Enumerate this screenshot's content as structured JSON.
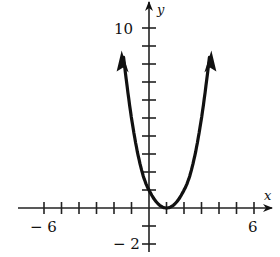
{
  "chart_data": {
    "type": "line",
    "title": "",
    "function": "y = (x - 1)^2",
    "xlabel": "x",
    "ylabel": "y",
    "xlim": [
      -6,
      6
    ],
    "ylim": [
      -2,
      10
    ],
    "x_tick_step": 1,
    "y_tick_step": 1,
    "x_tick_labels": [
      "-6",
      "6"
    ],
    "y_tick_labels": [
      "10",
      "-2"
    ],
    "vertex": [
      1,
      0
    ],
    "y_intercept": [
      0,
      1
    ],
    "series": [
      {
        "name": "parabola",
        "x": [
          -1.5,
          -1,
          0,
          1,
          2,
          3,
          3.5
        ],
        "y": [
          6.25,
          4,
          1,
          0,
          1,
          4,
          6.25
        ],
        "arrows": "both ends"
      }
    ],
    "grid": false,
    "legend": null
  },
  "labels": {
    "x_axis": "x",
    "y_axis": "y",
    "x_min": "− 6",
    "x_max": "6",
    "y_max": "10",
    "y_min": "− 2"
  }
}
